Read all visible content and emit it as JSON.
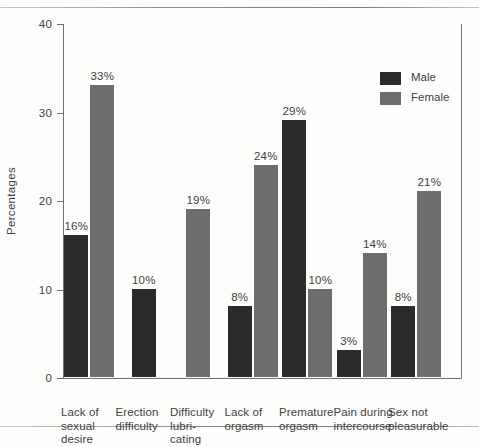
{
  "chart_data": {
    "type": "bar",
    "title": "",
    "xlabel": "",
    "ylabel": "Percentages",
    "ylim": [
      0,
      40
    ],
    "yticks": [
      0,
      10,
      20,
      30,
      40
    ],
    "ytick_labels": [
      "0",
      "10",
      "20",
      "30",
      "40"
    ],
    "grid": false,
    "legend_position": "upper right",
    "categories": [
      "Lack of sexual desire",
      "Erection difficulty",
      "Difficulty lubricating",
      "Lack of orgasm",
      "Premature orgasm",
      "Pain during intercourse",
      "Sex not pleasurable"
    ],
    "category_label_lines": [
      [
        "Lack of",
        "sexual",
        "desire"
      ],
      [
        "Erection",
        "difficulty"
      ],
      [
        "Difficulty",
        "lubri-",
        "cating"
      ],
      [
        "Lack of",
        "orgasm"
      ],
      [
        "Premature",
        "orgasm"
      ],
      [
        "Pain during",
        "intercourse"
      ],
      [
        "Sex not",
        "pleasurable"
      ]
    ],
    "series": [
      {
        "name": "Male",
        "color": "#2b2b2b",
        "values": [
          16,
          10,
          null,
          8,
          29,
          3,
          8
        ],
        "labels": [
          "16%",
          "10%",
          "",
          "8%",
          "29%",
          "3%",
          "8%"
        ]
      },
      {
        "name": "Female",
        "color": "#6d6d6d",
        "values": [
          33,
          null,
          19,
          24,
          10,
          14,
          21
        ],
        "labels": [
          "33%",
          "",
          "19%",
          "24%",
          "10%",
          "14%",
          "21%"
        ]
      }
    ]
  },
  "legend": {
    "items": [
      {
        "label": "Male",
        "color": "#2b2b2b"
      },
      {
        "label": "Female",
        "color": "#6d6d6d"
      }
    ]
  }
}
